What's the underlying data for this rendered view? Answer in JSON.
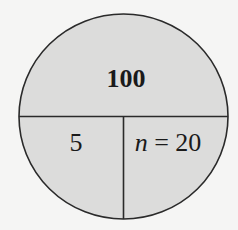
{
  "diagram": {
    "type": "divided-circle",
    "regions": {
      "top": {
        "label": "100"
      },
      "bottom_left": {
        "label": "5"
      },
      "bottom_right": {
        "variable": "n",
        "operator": " = ",
        "value": "20"
      }
    },
    "colors": {
      "fill": "#dcdcdb",
      "stroke": "#2a2a2a",
      "background": "#f5f5f4",
      "text": "#1a1a1a"
    }
  }
}
